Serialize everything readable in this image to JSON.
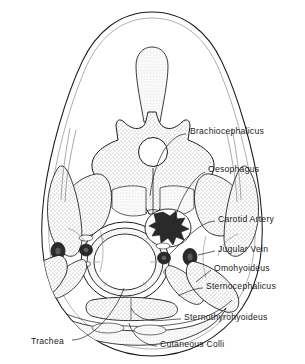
{
  "figure": {
    "kind": "anatomical-cross-section",
    "background_color": "#ffffff",
    "line_color": "#1a1a1a",
    "stipple_color": "#9a9a9a",
    "dark_structure_color": "#2b2b2b",
    "lumen_color": "#ffffff"
  },
  "labels": [
    {
      "id": "brachiocephalicus",
      "text": "Brachiocephalicus",
      "x": 190,
      "y": 131
    },
    {
      "id": "oesophagus",
      "text": "Oesophagus",
      "x": 208,
      "y": 169
    },
    {
      "id": "carotid-artery",
      "text": "Carotid Artery",
      "x": 218,
      "y": 219
    },
    {
      "id": "jugular-vein",
      "text": "Jugular Vein",
      "x": 218,
      "y": 249
    },
    {
      "id": "omohyoideus",
      "text": "Omohyoideus",
      "x": 214,
      "y": 268
    },
    {
      "id": "sternocephalicus",
      "text": "Sternocephalicus",
      "x": 206,
      "y": 286
    },
    {
      "id": "sternothyrohyoideus",
      "text": "Sternothyrohyoideus",
      "x": 184,
      "y": 317
    },
    {
      "id": "cutaneous-colli",
      "text": "Cutaneous Colli",
      "x": 160,
      "y": 344
    },
    {
      "id": "trachea",
      "text": "Trachea",
      "x": 31,
      "y": 341
    }
  ],
  "structures": [
    {
      "id": "body-outline",
      "name": "neck outline"
    },
    {
      "id": "nuchal-ligament",
      "name": "nuchal ligament / spinous process"
    },
    {
      "id": "vertebra",
      "name": "cervical vertebra"
    },
    {
      "id": "spinal-canal",
      "name": "vertebral canal"
    },
    {
      "id": "trachea-lumen",
      "name": "tracheal lumen"
    },
    {
      "id": "trachea-ring",
      "name": "tracheal cartilage ring"
    },
    {
      "id": "oesophagus-body",
      "name": "oesophagus"
    },
    {
      "id": "carotid-vessel",
      "name": "carotid artery"
    },
    {
      "id": "jugular-vessel",
      "name": "jugular vein"
    }
  ]
}
